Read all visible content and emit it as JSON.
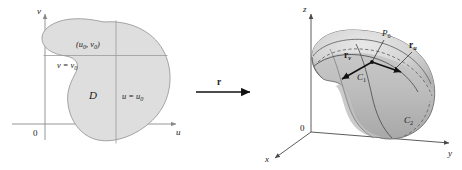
{
  "figure": {
    "caption": "Parametric surface mapping from the uv-plane domain D to a surface in xyz-space",
    "colors": {
      "region_fill": "#dedede",
      "region_stroke": "#9a9a9a",
      "axis": "#8a8a8a",
      "axis_3d": "#4a4a4a",
      "vector": "#111111",
      "curve": "#555555",
      "background": "#ffffff"
    }
  },
  "left_panel": {
    "name": "uv-plane",
    "axes": {
      "vertical_label": "v",
      "horizontal_label": "u",
      "origin_label": "0"
    },
    "region_label": "D",
    "point_label": "(u",
    "point_label_sub1": "0",
    "point_label_mid": ", v",
    "point_label_sub2": "0",
    "point_label_end": ")",
    "gridline_v_label": "v = v",
    "gridline_v_sub": "0",
    "gridline_u_label": "u = u",
    "gridline_u_sub": "0"
  },
  "map_arrow": {
    "label": "r"
  },
  "right_panel": {
    "name": "xyz-space",
    "axes": {
      "z_label": "z",
      "y_label": "y",
      "x_label": "x",
      "origin_label": "0"
    },
    "point_label": "P",
    "point_sub": "0",
    "vector_u_label": "r",
    "vector_u_sub": "u",
    "vector_v_label": "r",
    "vector_v_sub": "v",
    "curve1_label": "C",
    "curve1_sub": "1",
    "curve2_label": "C",
    "curve2_sub": "2"
  }
}
